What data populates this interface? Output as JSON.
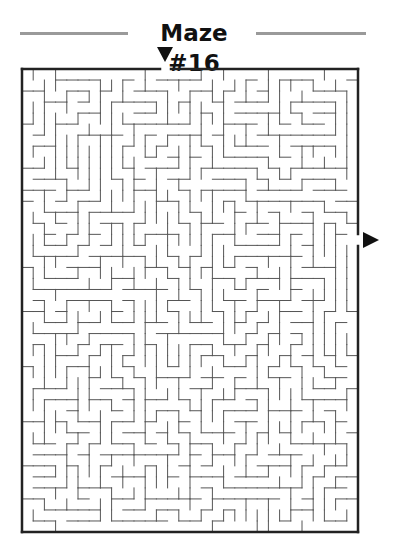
{
  "title": "Maze #16",
  "colors": {
    "wall": "#555555",
    "border": "#222222",
    "rule": "#9a9a9a",
    "arrow": "#111111"
  },
  "maze": {
    "box": {
      "x": 22,
      "y": 69,
      "width": 336,
      "height": 463
    },
    "cols": 30,
    "rows": 42,
    "entrance": {
      "side": "top",
      "gap_x_start": 160,
      "gap_x_end": 171,
      "marker": "down-triangle"
    },
    "exit": {
      "side": "right",
      "gap_y_start": 234,
      "gap_y_end": 246,
      "marker": "right-triangle"
    }
  }
}
